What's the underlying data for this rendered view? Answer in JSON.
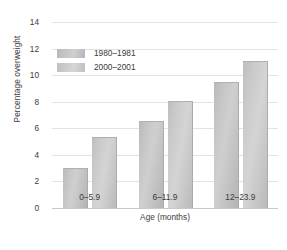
{
  "chart_data": {
    "type": "bar",
    "title": "",
    "categories": [
      "0–5.9",
      "6–11.9",
      "12–23.9"
    ],
    "series": [
      {
        "name": "1980–1981",
        "values": [
          2.9,
          6.5,
          9.4
        ],
        "color": "#c6c6c6"
      },
      {
        "name": "2000–2001",
        "values": [
          5.3,
          8.0,
          11.0
        ],
        "color": "#cfcfcf"
      }
    ],
    "xlabel": "Age (months)",
    "ylabel": "Percentage overweight",
    "ylim": [
      0,
      14
    ],
    "yticks": [
      0,
      2,
      4,
      6,
      8,
      10,
      12,
      14
    ],
    "ytick_labels": [
      "0",
      "2",
      "4",
      "6",
      "8",
      "10",
      "12",
      "14"
    ],
    "grid": true,
    "grid_axis": "y",
    "legend_position": "upper-left-inside"
  }
}
